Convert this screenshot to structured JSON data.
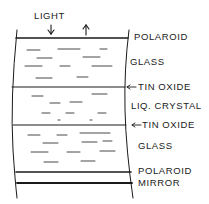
{
  "diagram": {
    "type": "layer-cross-section",
    "light_label": "LIGHT",
    "layers": [
      {
        "name": "polaroid-top",
        "label": "POLAROID"
      },
      {
        "name": "glass-top",
        "label": "GLASS"
      },
      {
        "name": "tin-oxide-top",
        "label": "TIN OXIDE",
        "arrow": true
      },
      {
        "name": "liquid-crystal",
        "label": "LIQ. CRYSTAL"
      },
      {
        "name": "tin-oxide-bottom",
        "label": "TIN OXIDE",
        "arrow": true
      },
      {
        "name": "glass-bottom",
        "label": "GLASS"
      },
      {
        "name": "polaroid-bottom",
        "label": "POLAROID"
      },
      {
        "name": "mirror",
        "label": "MIRROR"
      }
    ],
    "colors": {
      "ink": "#1a1a1a",
      "background": "#ffffff"
    }
  }
}
